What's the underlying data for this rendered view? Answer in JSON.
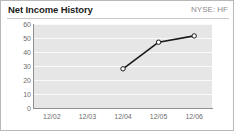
{
  "header": {
    "title": "Net Income History",
    "ticker": "NYSE: HF"
  },
  "colors": {
    "title_text": "#1c1c1c",
    "ticker_text": "#8d8d8d",
    "plot_background": "#e6e6e6",
    "gridline": "#fafafa",
    "axis": "#8f8f8f",
    "tick_text": "#6d6d6d",
    "series_line": "#1a1a1a",
    "marker_fill": "#ffffff",
    "card_border": "#b8b8b8"
  },
  "chart_data": {
    "type": "line",
    "title": "Net Income History",
    "subtitle": "NYSE: HF",
    "xlabel": "",
    "ylabel": "",
    "categories": [
      "12/02",
      "12/03",
      "12/04",
      "12/05",
      "12/06"
    ],
    "series": [
      {
        "name": "Net Income",
        "values": [
          null,
          null,
          28,
          47,
          51.5
        ]
      }
    ],
    "ylim": [
      0,
      60
    ],
    "yticks": [
      0,
      10,
      20,
      30,
      40,
      50,
      60
    ],
    "ytick_labels": [
      "0",
      "10",
      "20",
      "30",
      "40",
      "50",
      "60"
    ],
    "grid": true,
    "grid_axis": "y",
    "legend": false,
    "markers": "open-circle"
  }
}
